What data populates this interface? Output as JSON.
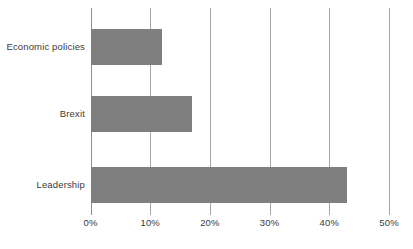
{
  "chart_data": {
    "type": "bar",
    "orientation": "horizontal",
    "title": "",
    "subtitle": "",
    "xlabel": "",
    "ylabel": "",
    "categories": [
      "Economic policies",
      "Brexit",
      "Leadership"
    ],
    "values": [
      12,
      17,
      43
    ],
    "value_suffix": "%",
    "series": [
      {
        "name": "",
        "values": [
          12,
          17,
          43
        ]
      }
    ],
    "xlim": [
      0,
      50
    ],
    "xticks": [
      0,
      10,
      20,
      30,
      40,
      50
    ],
    "xtick_labels": [
      "0%",
      "10%",
      "20%",
      "30%",
      "40%",
      "50%"
    ],
    "grid": true,
    "grid_axis": "x",
    "legend": false,
    "legend_position": "none",
    "annotations": [],
    "colors": {
      "bar_fill": "#7f7f7f",
      "gridline": "#a6a6a6",
      "axis": "#8f8f8f",
      "text": "#3b3b3b",
      "background": "#ffffff"
    }
  }
}
